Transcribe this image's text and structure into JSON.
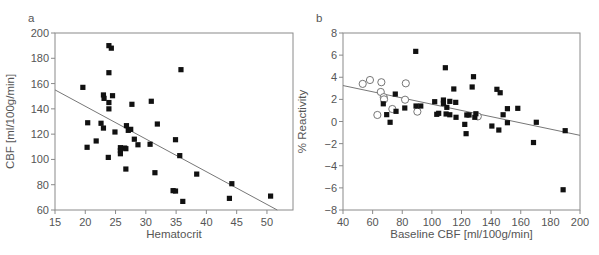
{
  "chart_data": [
    {
      "panel": "a",
      "type": "scatter",
      "title": "",
      "xlabel": "Hematocrit",
      "ylabel": "CBF [ml/100g/min]",
      "xlim": [
        15,
        54.3
      ],
      "ylim": [
        60,
        200
      ],
      "xticks": [
        15,
        20,
        25,
        30,
        35,
        40,
        45,
        50
      ],
      "yticks": [
        60,
        80,
        100,
        120,
        140,
        160,
        180,
        200
      ],
      "grid": false,
      "legend": null,
      "series": [
        {
          "name": "patients",
          "marker": "filled-square",
          "points": [
            [
              19.6,
              157
            ],
            [
              20.4,
              129
            ],
            [
              20.3,
              109.6
            ],
            [
              21.8,
              114.6
            ],
            [
              22.6,
              128.6
            ],
            [
              23.0,
              124.8
            ],
            [
              23.0,
              151
            ],
            [
              23.1,
              148.3
            ],
            [
              23.9,
              190
            ],
            [
              24.3,
              188
            ],
            [
              23.9,
              168.6
            ],
            [
              23.9,
              145
            ],
            [
              23.9,
              140
            ],
            [
              24.5,
              150.4
            ],
            [
              23.8,
              101.6
            ],
            [
              24.9,
              121.7
            ],
            [
              26.8,
              126.7
            ],
            [
              27.1,
              123
            ],
            [
              27.5,
              123.8
            ],
            [
              27.7,
              143.6
            ],
            [
              28.1,
              116
            ],
            [
              28.7,
              111.6
            ],
            [
              25.8,
              109.3
            ],
            [
              25.8,
              107
            ],
            [
              25.8,
              104.5
            ],
            [
              26.5,
              109
            ],
            [
              26.7,
              108.5
            ],
            [
              26.7,
              92.4
            ],
            [
              30.7,
              112
            ],
            [
              30.9,
              146
            ],
            [
              31.9,
              128
            ],
            [
              31.5,
              89.5
            ],
            [
              34.9,
              115.6
            ],
            [
              35.6,
              103
            ],
            [
              35.8,
              171
            ],
            [
              34.5,
              75.3
            ],
            [
              34.9,
              75
            ],
            [
              36.1,
              66.8
            ],
            [
              38.4,
              88.4
            ],
            [
              44.2,
              80.8
            ],
            [
              43.8,
              69.2
            ],
            [
              50.6,
              71
            ]
          ]
        }
      ],
      "regression_line": [
        [
          15,
          155
        ],
        [
          51.7,
          60
        ]
      ]
    },
    {
      "panel": "b",
      "type": "scatter",
      "title": "",
      "xlabel": "Baseline CBF [ml/100g/min]",
      "ylabel": "% Reactivity",
      "xlim": [
        40,
        200
      ],
      "ylim": [
        -8,
        8
      ],
      "xticks": [
        40,
        60,
        80,
        100,
        120,
        140,
        160,
        180,
        200
      ],
      "yticks": [
        -8,
        -6,
        -4,
        -2,
        0,
        2,
        4,
        6,
        8
      ],
      "grid": false,
      "legend": null,
      "series": [
        {
          "name": "open-circles",
          "marker": "open-circle",
          "points": [
            [
              53.3,
              3.4
            ],
            [
              58.2,
              3.75
            ],
            [
              65.9,
              3.55
            ],
            [
              65.5,
              2.67
            ],
            [
              67.5,
              2.2
            ],
            [
              67.7,
              2.0
            ],
            [
              82.4,
              3.45
            ],
            [
              81.9,
              1.97
            ],
            [
              73.3,
              1.13
            ],
            [
              63.2,
              0.59
            ],
            [
              90.2,
              0.89
            ],
            [
              131,
              0.46
            ]
          ]
        },
        {
          "name": "filled-squares",
          "marker": "filled-square",
          "points": [
            [
              67.2,
              1.6
            ],
            [
              75.3,
              2.48
            ],
            [
              75.8,
              0.92
            ],
            [
              69.5,
              0.62
            ],
            [
              71.8,
              -0.07
            ],
            [
              81.7,
              1.22
            ],
            [
              89.1,
              6.34
            ],
            [
              89.3,
              1.4
            ],
            [
              92.5,
              1.4
            ],
            [
              101.9,
              1.79
            ],
            [
              103.3,
              0.65
            ],
            [
              104.6,
              0.74
            ],
            [
              109.1,
              4.86
            ],
            [
              107.8,
              1.94
            ],
            [
              107.8,
              1.64
            ],
            [
              110.1,
              1.28
            ],
            [
              109.6,
              0.68
            ],
            [
              112.1,
              1.82
            ],
            [
              112.1,
              0.61
            ],
            [
              114.8,
              2.94
            ],
            [
              116.1,
              1.73
            ],
            [
              116.3,
              0.38
            ],
            [
              122.2,
              -0.26
            ],
            [
              123.1,
              -1.1
            ],
            [
              123.6,
              0.59
            ],
            [
              125.1,
              0.59
            ],
            [
              127.2,
              3.12
            ],
            [
              128.1,
              4.05
            ],
            [
              129,
              0.38
            ],
            [
              129.7,
              0.7
            ],
            [
              140.5,
              -0.41
            ],
            [
              143.9,
              2.91
            ],
            [
              146.1,
              2.6
            ],
            [
              145.2,
              -0.77
            ],
            [
              148.1,
              0.61
            ],
            [
              151,
              1.16
            ],
            [
              151,
              -0.11
            ],
            [
              158,
              1.19
            ],
            [
              170.5,
              -0.07
            ],
            [
              168.6,
              -1.9
            ],
            [
              190,
              -0.83
            ],
            [
              188.6,
              -6.17
            ]
          ]
        }
      ],
      "regression_line": [
        [
          40,
          3.25
        ],
        [
          200,
          -1.25
        ]
      ]
    }
  ],
  "colors": {
    "axis": "#8a8a8a",
    "text": "#555555",
    "marker": "#111111",
    "line": "#777777"
  }
}
